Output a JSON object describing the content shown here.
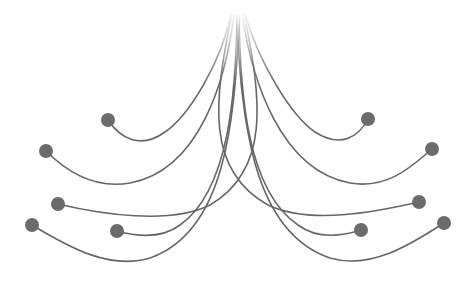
{
  "diagram": {
    "width": 476,
    "height": 282,
    "background": "#ffffff",
    "line_color": "#666666",
    "node_color": "#6b6b6b",
    "line_width": 1.6,
    "node_radius": 7,
    "origin": {
      "x": 238,
      "y": 12
    },
    "fade_end_y": 85,
    "branches": [
      {
        "side": "left",
        "node": {
          "x": 108,
          "y": 120
        },
        "path": "M 231 14 C 222 60, 190 115, 165 132 C 140 150, 120 138, 108 120"
      },
      {
        "side": "left",
        "node": {
          "x": 46,
          "y": 151
        },
        "path": "M 234 14 C 226 80, 200 170, 130 183 C 90 190, 60 165, 46 151"
      },
      {
        "side": "left",
        "node": {
          "x": 58,
          "y": 204
        },
        "path": "M 244 14 C 262 100, 270 170, 210 205 C 170 225, 100 214, 58 204"
      },
      {
        "side": "left",
        "node": {
          "x": 32,
          "y": 225
        },
        "path": "M 240 14 C 234 110, 230 230, 150 258 C 110 270, 70 248, 32 225"
      },
      {
        "side": "left",
        "node": {
          "x": 117,
          "y": 231
        },
        "path": "M 237 14 C 236 90, 230 190, 180 225 C 160 240, 135 236, 117 231"
      },
      {
        "side": "right",
        "node": {
          "x": 368,
          "y": 119
        },
        "path": "M 245 14 C 258 60, 290 115, 315 132 C 340 148, 358 138, 368 119"
      },
      {
        "side": "right",
        "node": {
          "x": 432,
          "y": 149
        },
        "path": "M 242 14 C 252 80, 280 170, 350 183 C 390 190, 415 163, 432 149"
      },
      {
        "side": "right",
        "node": {
          "x": 419,
          "y": 202
        },
        "path": "M 232 14 C 214 100, 205 170, 268 205 C 310 225, 375 212, 419 202"
      },
      {
        "side": "right",
        "node": {
          "x": 444,
          "y": 223
        },
        "path": "M 236 14 C 242 110, 248 230, 330 258 C 370 270, 410 245, 444 223"
      },
      {
        "side": "right",
        "node": {
          "x": 361,
          "y": 230
        },
        "path": "M 239 14 C 240 90, 246 190, 298 225 C 318 240, 342 236, 361 230"
      }
    ]
  }
}
